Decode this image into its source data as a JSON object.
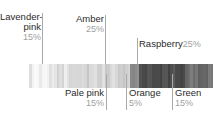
{
  "chart_data": {
    "type": "bar",
    "title": "",
    "subtitle": "",
    "xlabel": "",
    "ylabel": "",
    "orientation": "horizontal-stacked",
    "grid": false,
    "legend_position": "callouts",
    "unit": "%",
    "total": 100,
    "categories": [
      "Lavender-pink",
      "Pale pink",
      "Amber",
      "Orange",
      "Raspberry",
      "Green"
    ],
    "values": [
      15,
      15,
      25,
      5,
      25,
      15
    ],
    "colors": [
      "#ececec",
      "#e0e0e0",
      "#d2d2d2",
      "#8f8f8f",
      "#4e4e4e",
      "#6f6f6f"
    ],
    "series": [
      {
        "name": "Color proportions",
        "values": [
          15,
          15,
          25,
          5,
          25,
          15
        ]
      }
    ],
    "annotations": [
      {
        "label": "Lavender-pink",
        "value": "15%",
        "position": "top",
        "align": "right"
      },
      {
        "label": "Amber",
        "value": "25%",
        "position": "top",
        "align": "right"
      },
      {
        "label": "Raspberry",
        "value": "25%",
        "position": "top",
        "align": "left",
        "inline": true
      },
      {
        "label": "Pale pink",
        "value": "15%",
        "position": "bottom",
        "align": "right"
      },
      {
        "label": "Orange",
        "value": "5%",
        "position": "bottom",
        "align": "left"
      },
      {
        "label": "Green",
        "value": "15%",
        "position": "bottom",
        "align": "left"
      }
    ]
  },
  "callouts": {
    "lavender_pink": {
      "name": "Lavender-",
      "name2": "pink",
      "pct": "15%"
    },
    "amber": {
      "name": "Amber",
      "pct": "25%"
    },
    "raspberry": {
      "name": "Raspberry",
      "pct": "25%"
    },
    "pale_pink": {
      "name": "Pale pink",
      "pct": "15%"
    },
    "orange": {
      "name": "Orange",
      "pct": "5%"
    },
    "green": {
      "name": "Green",
      "pct": "15%"
    }
  }
}
